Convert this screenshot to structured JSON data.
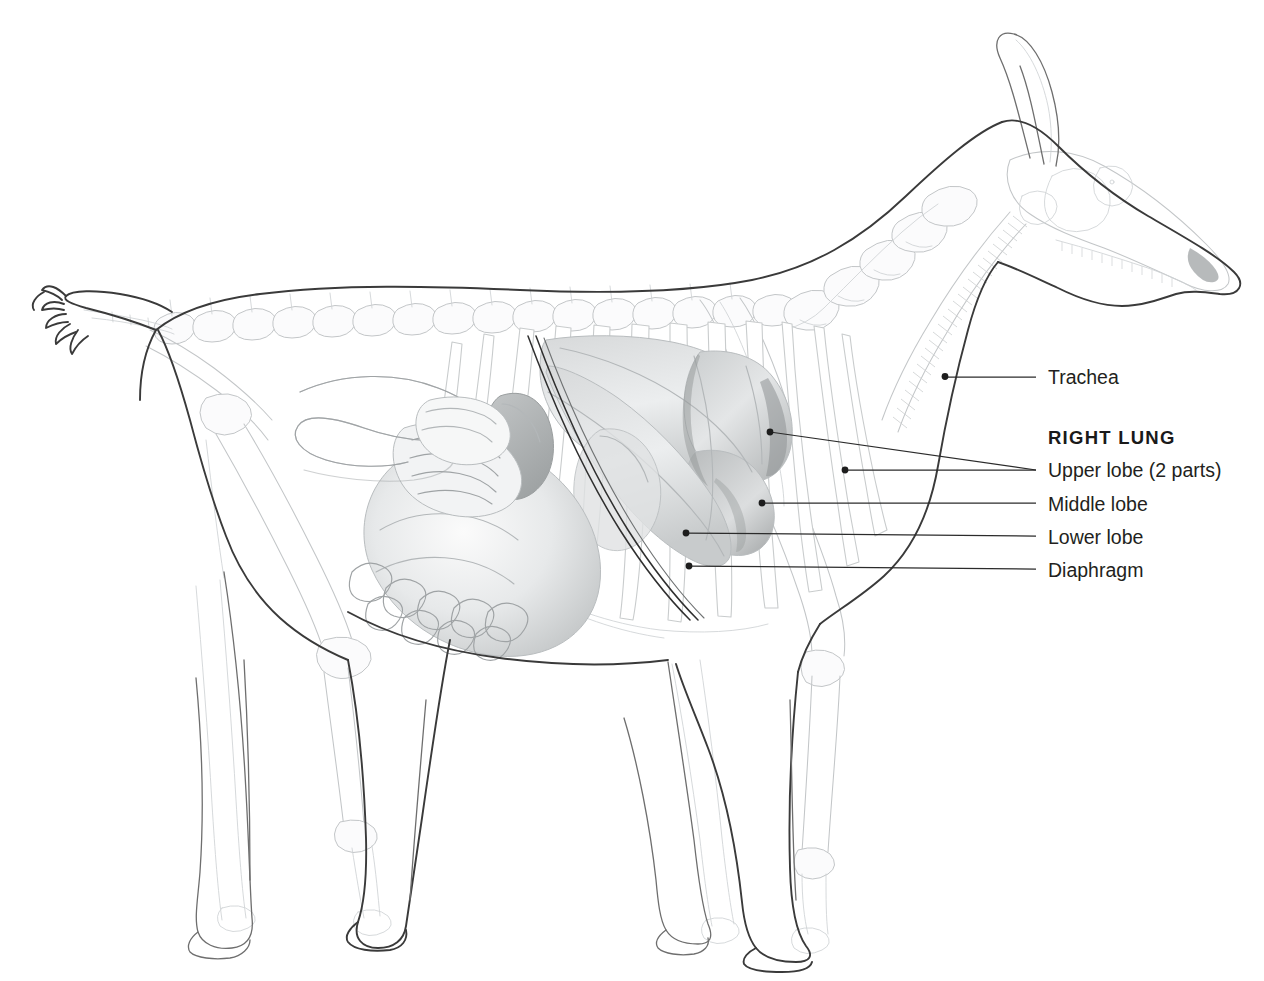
{
  "figure": {
    "view": "right lateral",
    "background_color": "#ffffff",
    "line_color": "#3a3a3a",
    "leader_color": "#2b2b2b",
    "label_color": "#231f20"
  },
  "labels": {
    "trachea": "Trachea",
    "right_lung_heading": "RIGHT LUNG",
    "upper_lobe": "Upper lobe (2 parts)",
    "middle_lobe": "Middle lobe",
    "lower_lobe": "Lower lobe",
    "diaphragm": "Diaphragm"
  },
  "callouts": [
    {
      "id": "trachea",
      "label": "Trachea",
      "label_x": 1048,
      "label_y": 384,
      "line_x1": 1036,
      "line_y1": 377,
      "line_x2": 962,
      "line_y2": 377,
      "anchors": [
        [
          945,
          376
        ]
      ]
    },
    {
      "id": "upper-lobe",
      "label": "Upper lobe (2 parts)",
      "label_x": 1048,
      "label_y": 477,
      "line_x1": 1036,
      "line_y1": 470,
      "line_x2": 962,
      "line_y2": 470,
      "anchors": [
        [
          770,
          432
        ],
        [
          845,
          470
        ]
      ]
    },
    {
      "id": "middle-lobe",
      "label": "Middle lobe",
      "label_x": 1048,
      "label_y": 511,
      "line_x1": 1036,
      "line_y1": 503,
      "line_x2": 962,
      "line_y2": 503,
      "anchors": [
        [
          762,
          503
        ]
      ]
    },
    {
      "id": "lower-lobe",
      "label": "Lower lobe",
      "label_x": 1048,
      "label_y": 544,
      "line_x1": 1036,
      "line_y1": 536,
      "line_x2": 962,
      "line_y2": 536,
      "anchors": [
        [
          685,
          533
        ]
      ]
    },
    {
      "id": "diaphragm",
      "label": "Diaphragm",
      "label_x": 1048,
      "label_y": 577,
      "line_x1": 1036,
      "line_y1": 569,
      "line_x2": 962,
      "line_y2": 569,
      "anchors": [
        [
          688,
          566
        ]
      ]
    }
  ],
  "heading": {
    "text": "RIGHT LUNG",
    "x": 1048,
    "y": 444
  },
  "anatomy_regions": [
    "head and skull",
    "horns",
    "cervical vertebrae",
    "trachea",
    "thoracic vertebrae",
    "ribcage",
    "right lung upper lobe",
    "right lung middle lobe",
    "right lung lower lobe",
    "diaphragm",
    "rumen",
    "intestines",
    "spiral colon",
    "pelvis",
    "scapula",
    "forelimb bones",
    "hindlimb bones",
    "hooves",
    "tail"
  ]
}
